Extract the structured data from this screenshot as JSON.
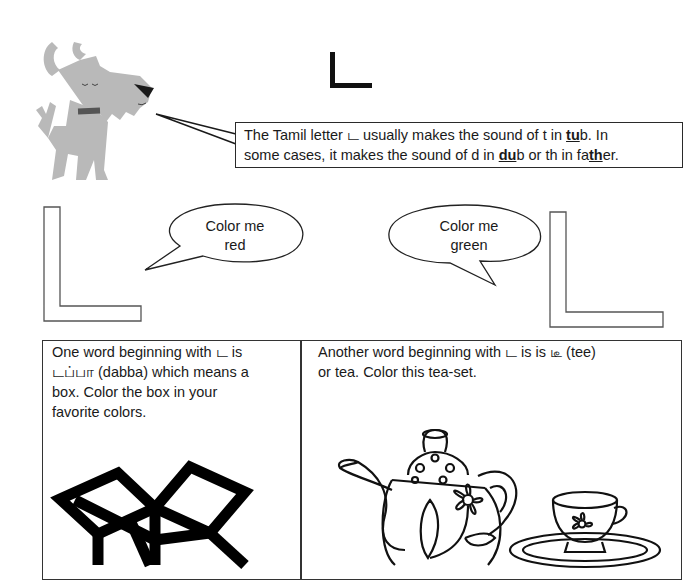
{
  "heading": {
    "letter": "ட"
  },
  "intro": {
    "line1_pre": "The Tamil letter ",
    "line1_letter": "ட",
    "line1_mid": " usually makes the sound of t in ",
    "line1_bold": "tu",
    "line1_post": "b. In",
    "line2_pre": "some cases, it makes the sound of d in ",
    "line2_bold1": "du",
    "line2_mid": "b or th in fa",
    "line2_bold2": "th",
    "line2_post": "er."
  },
  "bubbles": [
    {
      "line1": "Color me",
      "line2": "red"
    },
    {
      "line1": "Color me",
      "line2": "green"
    }
  ],
  "cells": [
    {
      "line1": "One word beginning with ட is",
      "line2": "டப்பா (dabba) which means a",
      "line3": "box. Color the box in your",
      "line4": "favorite colors.",
      "image": "open-box-outline"
    },
    {
      "line1": "Another word beginning with ட is is டீ (tee)",
      "line2": "or tea. Color this tea-set.",
      "image": "tea-set-outline"
    }
  ],
  "colors": {
    "ink": "#1a1a1a",
    "dog": "#b8b8b8",
    "collar": "#555555"
  }
}
